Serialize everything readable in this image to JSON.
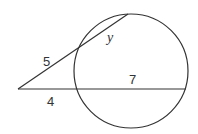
{
  "diagram": {
    "type": "circle-two-secants",
    "stroke_color": "#333333",
    "background": "#ffffff",
    "circle": {
      "cx": 131,
      "cy": 71,
      "r": 57
    },
    "vertex": {
      "x": 18,
      "y": 89
    },
    "upper_secant": {
      "end": {
        "x": 128,
        "y": 14
      },
      "external_label": "5",
      "internal_label": "y"
    },
    "lower_secant": {
      "end": {
        "x": 186,
        "y": 89
      },
      "external_label": "4",
      "internal_label": "7"
    }
  }
}
